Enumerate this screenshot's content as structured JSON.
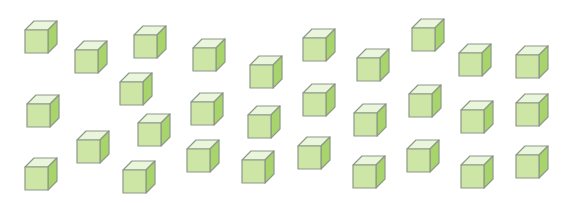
{
  "scene": {
    "description": "Scattered green cubes on white background",
    "cube_count": 30,
    "colors": {
      "front": "#cde6a6",
      "top": "#e9f6dc",
      "side": "#a8d46c",
      "outline": "#8e9888",
      "background": "#ffffff"
    },
    "cubes": [
      {
        "x": 24,
        "y": 20
      },
      {
        "x": 74,
        "y": 40
      },
      {
        "x": 133,
        "y": 25
      },
      {
        "x": 192,
        "y": 38
      },
      {
        "x": 249,
        "y": 55
      },
      {
        "x": 302,
        "y": 28
      },
      {
        "x": 356,
        "y": 48
      },
      {
        "x": 411,
        "y": 18
      },
      {
        "x": 458,
        "y": 43
      },
      {
        "x": 515,
        "y": 45
      },
      {
        "x": 26,
        "y": 94
      },
      {
        "x": 119,
        "y": 72
      },
      {
        "x": 190,
        "y": 92
      },
      {
        "x": 247,
        "y": 105
      },
      {
        "x": 302,
        "y": 83
      },
      {
        "x": 353,
        "y": 103
      },
      {
        "x": 408,
        "y": 84
      },
      {
        "x": 460,
        "y": 100
      },
      {
        "x": 515,
        "y": 93
      },
      {
        "x": 137,
        "y": 113
      },
      {
        "x": 24,
        "y": 157
      },
      {
        "x": 76,
        "y": 130
      },
      {
        "x": 122,
        "y": 160
      },
      {
        "x": 186,
        "y": 139
      },
      {
        "x": 241,
        "y": 150
      },
      {
        "x": 297,
        "y": 136
      },
      {
        "x": 352,
        "y": 155
      },
      {
        "x": 406,
        "y": 139
      },
      {
        "x": 460,
        "y": 155
      },
      {
        "x": 515,
        "y": 145
      }
    ]
  }
}
